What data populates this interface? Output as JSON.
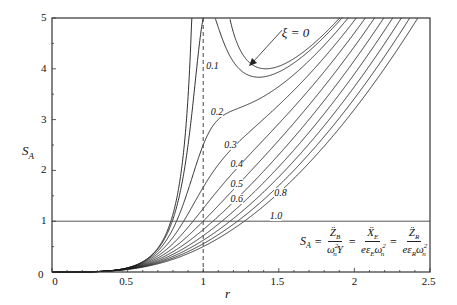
{
  "chart_data": {
    "type": "line",
    "title": "",
    "xlabel": "r",
    "ylabel": "S_A",
    "xlim": [
      0,
      2.5
    ],
    "ylim": [
      0,
      5
    ],
    "x_ticks": [
      "0",
      "0.5",
      "1",
      "1.5",
      "2",
      "2.5"
    ],
    "y_ticks": [
      "0",
      "1",
      "2",
      "3",
      "4",
      "5"
    ],
    "grid": false,
    "reference_lines": [
      {
        "type": "horizontal",
        "y": 1,
        "style": "solid"
      },
      {
        "type": "vertical",
        "x": 1,
        "style": "dashed"
      }
    ],
    "formula": "S_A = r^4 / sqrt((1 - r^2)^2 + (2 xi r)^2)",
    "formula_label": "S_A = Z̈_B/(ω_n² Y) = Ẍ_E/(e ε_E ω_n²) = Z̈_R/(e ε_R ω_n²)",
    "sample_r": [
      0,
      0.25,
      0.5,
      0.75,
      1.0,
      1.25,
      1.5,
      1.75,
      2.0,
      2.25,
      2.5
    ],
    "series": [
      {
        "name": "ξ = 0",
        "xi": 0,
        "values": [
          0,
          0.004,
          0.083,
          0.723,
          null,
          4.34,
          4.05,
          4.55,
          5.33,
          6.31,
          7.44
        ]
      },
      {
        "name": "0.1",
        "xi": 0.1,
        "values": [
          0,
          0.004,
          0.083,
          0.714,
          5.0,
          4.19,
          3.99,
          4.51,
          5.29,
          6.27,
          7.4
        ]
      },
      {
        "name": "0.2",
        "xi": 0.2,
        "values": [
          0,
          0.004,
          0.082,
          0.689,
          2.5,
          3.58,
          3.8,
          4.4,
          5.18,
          6.15,
          7.29
        ]
      },
      {
        "name": "0.3",
        "xi": 0.3,
        "values": [
          0,
          0.004,
          0.081,
          0.654,
          1.67,
          2.98,
          3.54,
          4.23,
          5.02,
          5.98,
          7.12
        ]
      },
      {
        "name": "0.4",
        "xi": 0.4,
        "values": [
          0,
          0.004,
          0.08,
          0.612,
          1.25,
          2.49,
          3.25,
          4.03,
          4.81,
          5.78,
          6.91
        ]
      },
      {
        "name": "0.5",
        "xi": 0.5,
        "values": [
          0,
          0.004,
          0.078,
          0.568,
          1.0,
          2.11,
          2.97,
          3.8,
          4.59,
          5.54,
          6.66
        ]
      },
      {
        "name": "0.6",
        "xi": 0.6,
        "values": [
          0,
          0.004,
          0.075,
          0.524,
          0.833,
          1.82,
          2.72,
          3.57,
          4.36,
          5.3,
          6.39
        ]
      },
      {
        "name": "0.7",
        "xi": 0.7,
        "values": [
          0,
          0.004,
          0.072,
          0.482,
          0.714,
          1.59,
          2.49,
          3.34,
          4.13,
          5.05,
          6.12
        ]
      },
      {
        "name": "0.8",
        "xi": 0.8,
        "values": [
          0,
          0.004,
          0.07,
          0.443,
          0.625,
          1.41,
          2.29,
          3.13,
          3.9,
          4.81,
          5.85
        ]
      },
      {
        "name": "0.9",
        "xi": 0.9,
        "values": [
          0,
          0.004,
          0.067,
          0.408,
          0.556,
          1.26,
          2.11,
          2.93,
          3.69,
          4.58,
          5.6
        ]
      },
      {
        "name": "1.0",
        "xi": 1.0,
        "values": [
          0,
          0.004,
          0.063,
          0.375,
          0.5,
          1.14,
          1.95,
          2.75,
          3.2,
          4.36,
          5.35
        ]
      }
    ],
    "curve_labels": [
      {
        "text": "ξ = 0",
        "r": 1.52,
        "y": 4.7,
        "arrow_to": {
          "r": 1.28,
          "y": 4.15
        }
      },
      {
        "text": "0.1",
        "r": 1.02,
        "y": 4.05
      },
      {
        "text": "0.2",
        "r": 1.05,
        "y": 3.15
      },
      {
        "text": "0.3",
        "r": 1.14,
        "y": 2.5
      },
      {
        "text": "0.4",
        "r": 1.18,
        "y": 2.13
      },
      {
        "text": "0.5",
        "r": 1.18,
        "y": 1.74
      },
      {
        "text": "0.6",
        "r": 1.18,
        "y": 1.43
      },
      {
        "text": "0.8",
        "r": 1.47,
        "y": 1.55
      },
      {
        "text": "1.0",
        "r": 1.44,
        "y": 1.1
      }
    ]
  },
  "labels": {
    "ylabel_main": "S",
    "ylabel_sub": "A",
    "xlabel": "r",
    "formula": {
      "lhs": "S",
      "lhs_sub": "A",
      "eq": "=",
      "f1_num": "Z̈",
      "f1_num_sub": "B",
      "f1_den": "ω",
      "f1_den_sub": "n",
      "f1_den_sup": "2",
      "f1_den_tail": "Y",
      "f2_num": "Ẍ",
      "f2_num_sub": "E",
      "f2_den": "eε",
      "f2_den_sub": "E",
      "f2_den_tail": "ω",
      "f2_den_tail_sub": "n",
      "f2_den_tail_sup": "2",
      "f3_num": "Z̈",
      "f3_num_sub": "R",
      "f3_den": "eε",
      "f3_den_sub": "R",
      "f3_den_tail": "ω",
      "f3_den_tail_sub": "n",
      "f3_den_tail_sup": "2"
    }
  },
  "colors": {
    "curve": "#1a1a1a",
    "axis": "#333333",
    "refline": "#555555"
  }
}
